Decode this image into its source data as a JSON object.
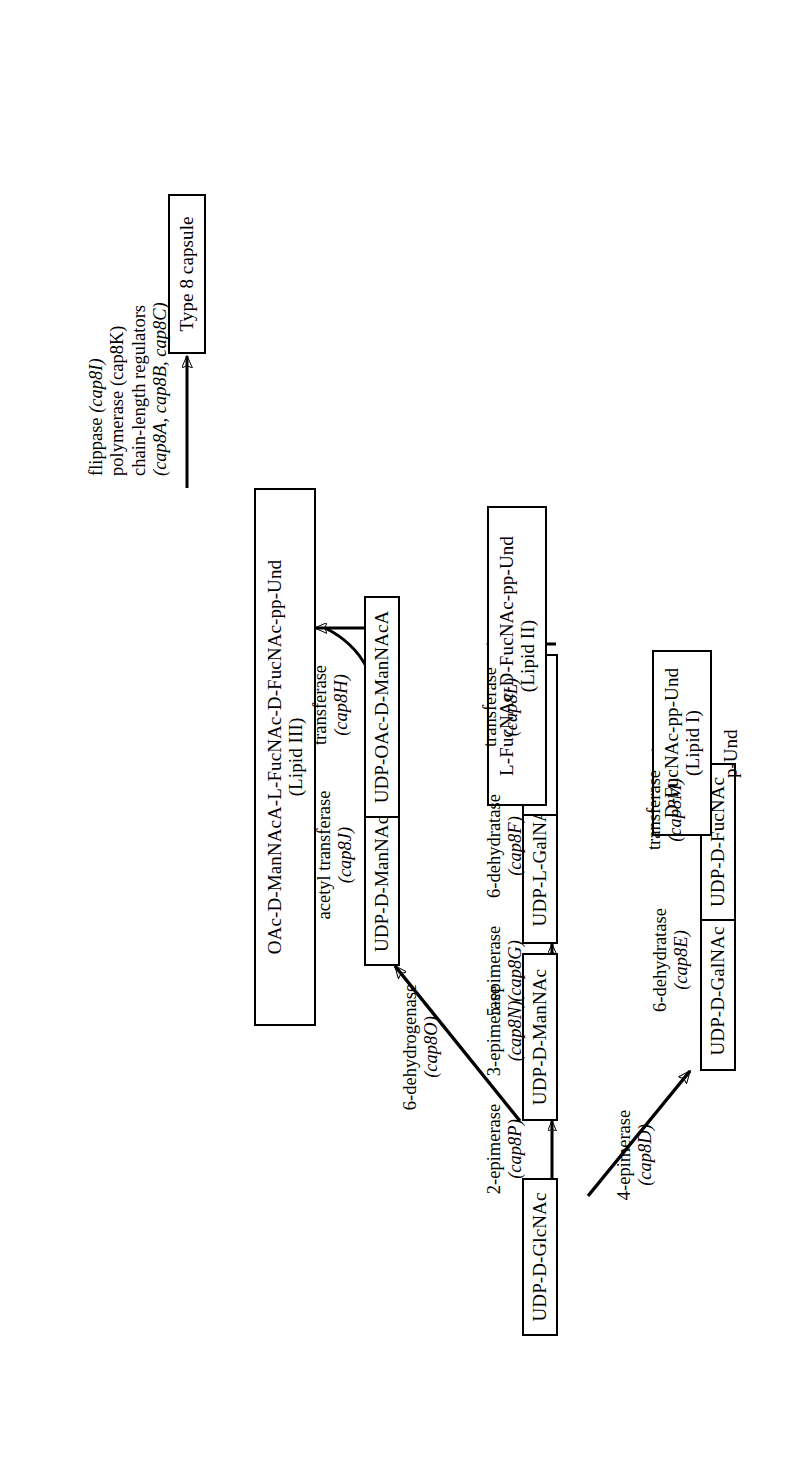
{
  "diagram": {
    "type": "pathway-flowchart",
    "orientation": "rotated-90-ccw",
    "nodes": [
      {
        "id": "udp_d_glcnac",
        "label": "UDP-D-GlcNAc",
        "sub": ""
      },
      {
        "id": "udp_d_mannac",
        "label": "UDP-D-ManNAc",
        "sub": ""
      },
      {
        "id": "udp_l_galnac",
        "label": "UDP-L-GalNAc",
        "sub": ""
      },
      {
        "id": "udp_l_fucnac",
        "label": "UDP-L-FucNAc",
        "sub": ""
      },
      {
        "id": "udp_d_mannaca",
        "label": "UDP-D-ManNAcA",
        "sub": ""
      },
      {
        "id": "udp_oac_d_mannaca",
        "label": "UDP-OAc-D-ManNAcA",
        "sub": ""
      },
      {
        "id": "udp_d_galnac",
        "label": "UDP-D-GalNAc",
        "sub": ""
      },
      {
        "id": "udp_d_fucnac",
        "label": "UDP-D-FucNAc",
        "sub": ""
      },
      {
        "id": "lipid1",
        "label": "D-FucNAc-pp-Und",
        "sub": "(Lipid I)"
      },
      {
        "id": "lipid2",
        "label": "L-FucNAc-D-FucNAc-pp-Und",
        "sub": "(Lipid II)"
      },
      {
        "id": "lipid3",
        "label": "OAc-D-ManNAcA-L-FucNAc-D-FucNAc-pp-Und",
        "sub": "(Lipid III)"
      },
      {
        "id": "capsule",
        "label": "Type 8 capsule",
        "sub": ""
      }
    ],
    "edge_labels": [
      {
        "id": "e_2epimerase",
        "enzyme": "2-epimerase",
        "genes": "(cap8P)"
      },
      {
        "id": "e_3epimerase",
        "enzyme": "3-epimerase",
        "genes": "(cap8N)"
      },
      {
        "id": "e_5epimerase",
        "enzyme": "5-epimerase",
        "genes": "(cap8G)"
      },
      {
        "id": "e_6dehydratase_f",
        "enzyme": "6-dehydratase",
        "genes": "(cap8F)"
      },
      {
        "id": "e_transferase_l",
        "enzyme": "transferase",
        "genes": "(cap8L)"
      },
      {
        "id": "e_6dehydrogenase",
        "enzyme": "6-dehydrogenase",
        "genes": "(cap8O)"
      },
      {
        "id": "e_acetyl_transferase",
        "enzyme": "acetyl transferase",
        "genes": "(cap8J)"
      },
      {
        "id": "e_transferase_h",
        "enzyme": "transferase",
        "genes": "(cap8H)"
      },
      {
        "id": "e_4epimerase",
        "enzyme": "4-epimerase",
        "genes": "(cap8D)"
      },
      {
        "id": "e_6dehydratase_e",
        "enzyme": "6-dehydratase",
        "genes": "(cap8E)"
      },
      {
        "id": "e_transferase_m",
        "enzyme": "transferase",
        "genes": "(cap8M)"
      }
    ],
    "final_step": {
      "line1_text": "flippase ",
      "line1_gene": "(cap8I)",
      "line2_text": "polymerase (cap8K)",
      "line3_text": "chain-length regulators",
      "line4_gene": "(cap8A,  cap8B,  cap8C)"
    },
    "precursor": {
      "label": "p-Und"
    }
  }
}
